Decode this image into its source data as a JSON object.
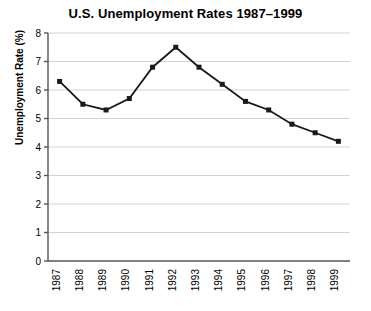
{
  "chart_data": {
    "type": "line",
    "title": "U.S. Unemployment Rates 1987–1999",
    "xlabel": "",
    "ylabel": "Unemployment Rate (%)",
    "categories": [
      "1987",
      "1988",
      "1989",
      "1990",
      "1991",
      "1992",
      "1993",
      "1994",
      "1995",
      "1996",
      "1997",
      "1998",
      "1999"
    ],
    "values": [
      6.3,
      5.5,
      5.3,
      5.7,
      6.8,
      7.5,
      6.8,
      6.2,
      5.6,
      5.3,
      4.8,
      4.5,
      4.2
    ],
    "series": [
      {
        "name": "Unemployment Rate",
        "values": [
          6.3,
          5.5,
          5.3,
          5.7,
          6.8,
          7.5,
          6.8,
          6.2,
          5.6,
          5.3,
          4.8,
          4.5,
          4.2
        ]
      }
    ],
    "ylim": [
      0,
      8
    ],
    "yticks": [
      0,
      1,
      2,
      3,
      4,
      5,
      6,
      7,
      8
    ],
    "ytick_labels": [
      "0",
      "1",
      "2",
      "3",
      "4",
      "5",
      "6",
      "7",
      "8"
    ],
    "grid": true,
    "grid_axis": "y",
    "legend": false,
    "legend_position": "none",
    "marker": "square",
    "line_color": "#1a1a1a",
    "grid_color": "#c8c8c8",
    "axis_color": "#555555",
    "background_color": "#ffffff",
    "xtick_rotation": -90
  }
}
